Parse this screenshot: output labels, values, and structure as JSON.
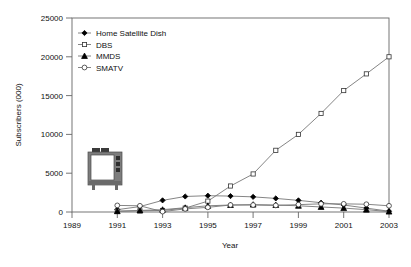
{
  "chart_data": {
    "type": "line",
    "title": "",
    "xlabel": "Year",
    "ylabel": "Subscribers (000)",
    "xlim": [
      1989,
      2003
    ],
    "ylim": [
      0,
      25000
    ],
    "xticks": [
      "1989",
      "1991",
      "1993",
      "1995",
      "1997",
      "1999",
      "2001",
      "2003"
    ],
    "yticks": [
      "0",
      "5000",
      "10000",
      "15000",
      "20000",
      "25000"
    ],
    "grid": false,
    "legend_position": "top-left",
    "x": [
      1991,
      1992,
      1993,
      1994,
      1995,
      1996,
      1997,
      1998,
      1999,
      2000,
      2001,
      2002,
      2003
    ],
    "series": [
      {
        "name": "Home Satellite Dish",
        "marker": "filled-diamond",
        "values": [
          300,
          700,
          1500,
          2000,
          2100,
          2050,
          1950,
          1750,
          1500,
          1200,
          900,
          500,
          100
        ]
      },
      {
        "name": "DBS",
        "marker": "open-square",
        "values": [
          100,
          150,
          200,
          500,
          1400,
          3350,
          4900,
          7950,
          10000,
          12700,
          15650,
          17800,
          20000
        ]
      },
      {
        "name": "MMDS",
        "marker": "filled-triangle",
        "values": [
          100,
          200,
          300,
          550,
          800,
          900,
          950,
          900,
          800,
          650,
          500,
          300,
          50
        ]
      },
      {
        "name": "SMATV",
        "marker": "open-circle",
        "values": [
          850,
          800,
          50,
          400,
          600,
          900,
          900,
          850,
          950,
          1050,
          1050,
          1000,
          800
        ]
      }
    ]
  },
  "legend": {
    "items": [
      {
        "label": "Home Satellite Dish"
      },
      {
        "label": "DBS"
      },
      {
        "label": "MMDS"
      },
      {
        "label": "SMATV"
      }
    ]
  },
  "decorations": {
    "tv_icon_name": "television-set-illustration"
  },
  "colors": {
    "axis": "#555555",
    "series_line": "#777777",
    "marker_fill_dark": "#000000",
    "marker_fill_light": "#ffffff",
    "tv_body": "#7d7d7d",
    "tv_screen": "#ffffff",
    "tv_dark": "#3a3a3a"
  }
}
